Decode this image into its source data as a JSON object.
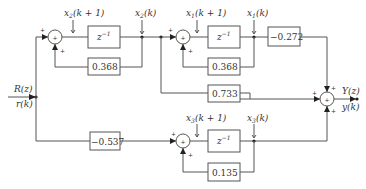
{
  "diagram": {
    "type": "signal-flow block diagram (discrete-time state-space realization)",
    "input": {
      "label_z": "R(z)",
      "label_k": "r(k)"
    },
    "output": {
      "label_z": "Y(z)",
      "label_k": "y(k)"
    },
    "states": {
      "x2": {
        "next": "x2(k + 1)",
        "current": "x2(k)",
        "sub": "2"
      },
      "x1": {
        "next": "x1(k + 1)",
        "current": "x1(k)",
        "sub": "1"
      },
      "x3": {
        "next": "x3(k + 1)",
        "current": "x3(k)",
        "sub": "3"
      }
    },
    "blocks": {
      "delay": "z",
      "delay_exp": "−1",
      "fb_x2": "0.368",
      "fb_x1": "0.368",
      "gain_out_x1": "−0.272",
      "gain_direct": "0.733",
      "gain_in_x3": "−0.537",
      "fb_x3": "0.135"
    },
    "summers": {
      "symbol": "+",
      "plus": "+"
    }
  }
}
